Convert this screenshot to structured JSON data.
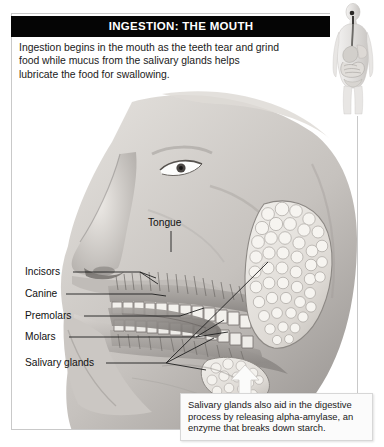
{
  "header": {
    "title": "INGESTION: THE MOUTH"
  },
  "intro": {
    "text": "Ingestion begins in the mouth as the teeth tear and grind food while mucus from the salivary glands helps lubricate the food for swallowing."
  },
  "labels": {
    "tongue": "Tongue",
    "incisors": "Incisors",
    "canine": "Canine",
    "premolars": "Premolars",
    "molars": "Molars",
    "salivary_glands": "Salivary glands"
  },
  "caption": {
    "text": "Salivary glands also aid in the digestive process by releasing alpha-amylase, an enzyme that breaks down starch."
  },
  "icons": {
    "body_figure": "human-body-digestive-figure",
    "up_arrow": "up-arrow-icon",
    "face_illustration": "head-profile-mouth-anatomy"
  },
  "colors": {
    "banner_bg": "#050505",
    "banner_text": "#ffffff",
    "panel_border": "#c9c9c9",
    "body_text": "#1a1a1a",
    "caption_bg": "#fbfbfb",
    "caption_border": "#d7d7d7",
    "leader_line": "#222222",
    "skin_light": "#e9e6e3",
    "skin_mid": "#b9b5b2",
    "skin_dark": "#7d7a78",
    "gland_fill": "#e6e4e0",
    "tooth_fill": "#f2f0ec"
  }
}
